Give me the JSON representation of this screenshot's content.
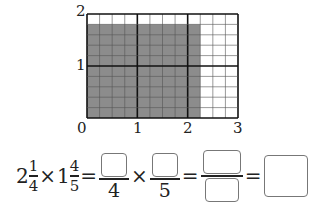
{
  "grid": {
    "x_labels": [
      "0",
      "1",
      "2",
      "3"
    ],
    "y_labels": [
      "2",
      "1"
    ],
    "units_x": 3,
    "units_y": 2,
    "subdiv_x": 4,
    "subdiv_y": 5,
    "shaded_cols": 9,
    "shaded_rows": 9,
    "shade_color": "#8c8c8c"
  },
  "equation": {
    "a_whole": "2",
    "a_num": "1",
    "a_den": "4",
    "times": "×",
    "b_whole": "1",
    "b_num": "4",
    "b_den": "5",
    "equals": "=",
    "f1_den": "4",
    "f2_den": "5"
  }
}
